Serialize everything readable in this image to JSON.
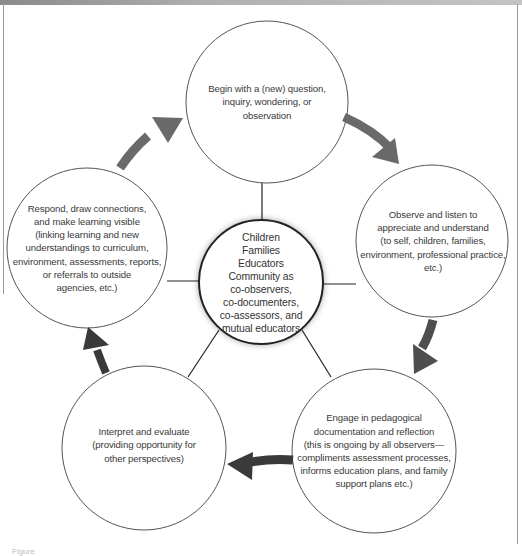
{
  "diagram": {
    "type": "cyclical-process",
    "colors": {
      "background": "#ffffff",
      "circle_stroke": "#555555",
      "connector": "#222222",
      "arrow_grey": "#6a6a6a",
      "arrow_dark": "#3a3a3a",
      "text": "#3a3a3a"
    },
    "center": {
      "lines": [
        "Children",
        "Families",
        "Educators",
        "Community as",
        "co-observers,",
        "co-documenters,",
        "co-assessors, and",
        "mutual educators"
      ]
    },
    "nodes": [
      {
        "id": "begin",
        "lines": [
          "Begin with a (new) question,",
          "inquiry, wondering, or",
          "observation"
        ]
      },
      {
        "id": "observe",
        "lines": [
          "Observe and listen to",
          "appreciate and understand",
          "(to self, children, families,",
          "environment, professional practice,",
          "etc.)"
        ]
      },
      {
        "id": "engage",
        "lines": [
          "Engage in pedagogical",
          "documentation and reflection",
          "(this is ongoing by all observers—",
          "compliments assessment processes,",
          "informs education plans, and family",
          "support plans etc.)"
        ]
      },
      {
        "id": "interpret",
        "lines": [
          "Interpret and evaluate",
          "(providing opportunity for",
          "other perspectives)"
        ]
      },
      {
        "id": "respond",
        "lines": [
          "Respond, draw connections,",
          "and make learning visible",
          "(linking learning and new",
          "understandings to curriculum,",
          "environment, assessments, reports,",
          "or referrals to outside",
          "agencies, etc.)"
        ]
      }
    ],
    "arrows": [
      {
        "from": "begin",
        "to": "observe",
        "icon": "arrow-right-down-icon"
      },
      {
        "from": "observe",
        "to": "engage",
        "icon": "arrow-down-icon"
      },
      {
        "from": "engage",
        "to": "interpret",
        "icon": "arrow-left-icon"
      },
      {
        "from": "interpret",
        "to": "respond",
        "icon": "arrow-up-icon"
      },
      {
        "from": "respond",
        "to": "begin",
        "icon": "arrow-up-right-icon"
      }
    ],
    "caption": "Figure"
  }
}
